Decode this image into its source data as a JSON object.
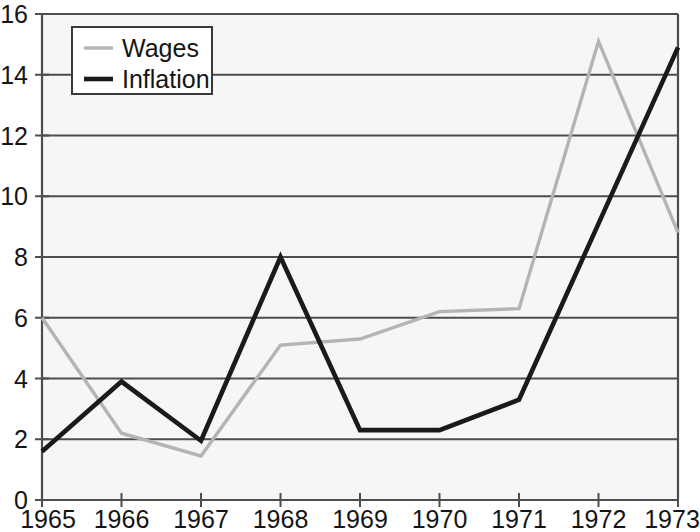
{
  "chart_data": {
    "type": "line",
    "title": "",
    "subtitle": "",
    "xlabel": "",
    "ylabel": "",
    "x": [
      1965,
      1966,
      1967,
      1968,
      1969,
      1970,
      1971,
      1972,
      1973
    ],
    "xticklabels": [
      "1965",
      "1966",
      "1967",
      "1968",
      "1969",
      "1970",
      "1971",
      "1972",
      "1973"
    ],
    "yticklabels": [
      "0",
      "2",
      "4",
      "6",
      "8",
      "10",
      "12",
      "14",
      "16"
    ],
    "yticks": [
      0,
      2,
      4,
      6,
      8,
      10,
      12,
      14,
      16
    ],
    "ylim": [
      0,
      16
    ],
    "xlim": [
      1965,
      1973
    ],
    "grid": "horizontal",
    "legend_position": "top-left",
    "series": [
      {
        "name": "Wages",
        "color": "#b4b4b4",
        "values": [
          6.0,
          2.2,
          1.45,
          5.1,
          5.3,
          6.2,
          6.3,
          15.1,
          8.8
        ]
      },
      {
        "name": "Inflation",
        "color": "#1a1a1a",
        "values": [
          1.6,
          3.9,
          1.95,
          8.0,
          2.3,
          2.3,
          3.3,
          9.1,
          14.9
        ]
      }
    ]
  },
  "colors": {
    "plot_background": "#f6f6f6",
    "axis": "#4d4d4d",
    "gridline": "#4d4d4d",
    "text": "#151515",
    "wages": "#b4b4b4",
    "inflation": "#1a1a1a"
  },
  "legend": {
    "items": [
      {
        "label": "Wages",
        "color": "#b4b4b4"
      },
      {
        "label": "Inflation",
        "color": "#1a1a1a"
      }
    ]
  }
}
